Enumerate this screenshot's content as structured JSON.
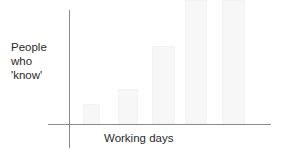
{
  "chart_data": {
    "type": "bar",
    "title": "",
    "xlabel": "Working days",
    "ylabel": "People who 'know'",
    "ylabel_lines": [
      "People",
      "who",
      "'know'"
    ],
    "categories": [
      "1",
      "2",
      "3",
      "4",
      "5"
    ],
    "values": [
      20,
      35,
      78,
      124,
      124
    ],
    "ylim": [
      0,
      124
    ],
    "grid": false,
    "legend": null,
    "bar_color": "#f7f7f7",
    "axis_color": "#8a8a8a"
  },
  "layout": {
    "plot_left": 69,
    "baseline_y": 124,
    "bars": [
      {
        "x": 83,
        "w": 17
      },
      {
        "x": 118,
        "w": 20
      },
      {
        "x": 152,
        "w": 23
      },
      {
        "x": 185,
        "w": 22
      },
      {
        "x": 222,
        "w": 23
      }
    ]
  }
}
